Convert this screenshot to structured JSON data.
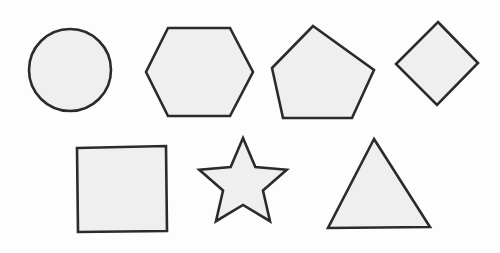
{
  "canvas": {
    "title": "Geometric Shapes",
    "width": 500,
    "height": 253,
    "background_color": "#fdfdfd",
    "shape_fill_color": "#efefef",
    "shape_stroke_color": "#2b2b2b",
    "shape_stroke_width": 2.6,
    "shape_count": 7,
    "row_count": 2
  },
  "shapes": [
    {
      "name": "circle",
      "label": "Circle",
      "row": 1,
      "position_in_row": 1,
      "geometry_type": "circle",
      "center_x": 70,
      "center_y": 70,
      "radius": 41,
      "bounds": {
        "x": 29,
        "y": 29,
        "width": 82,
        "height": 82
      },
      "sides": 0,
      "rotation_deg": 0
    },
    {
      "name": "hexagon",
      "label": "Hexagon",
      "row": 1,
      "position_in_row": 2,
      "geometry_type": "polygon",
      "points": "168,28 230,28 253,72 230,116 168,116 146,72",
      "bounds": {
        "x": 146,
        "y": 28,
        "width": 107,
        "height": 88
      },
      "sides": 6,
      "rotation_deg": 0
    },
    {
      "name": "pentagon",
      "label": "Pentagon",
      "row": 1,
      "position_in_row": 3,
      "geometry_type": "polygon",
      "points": "313,26 374,70 352,118 283,118 272,68",
      "bounds": {
        "x": 272,
        "y": 26,
        "width": 102,
        "height": 92
      },
      "sides": 5,
      "rotation_deg": 0
    },
    {
      "name": "diamond",
      "label": "Diamond",
      "row": 1,
      "position_in_row": 4,
      "geometry_type": "polygon",
      "points": "438,22 478,63 437,105 396,64",
      "bounds": {
        "x": 396,
        "y": 22,
        "width": 82,
        "height": 83
      },
      "sides": 4,
      "rotation_deg": 45
    },
    {
      "name": "square",
      "label": "Square",
      "row": 2,
      "position_in_row": 1,
      "geometry_type": "polygon",
      "points": "77,148 166,146 167,231 78,232",
      "bounds": {
        "x": 77,
        "y": 146,
        "width": 90,
        "height": 86
      },
      "sides": 4,
      "rotation_deg": 1
    },
    {
      "name": "star",
      "label": "Star",
      "row": 2,
      "position_in_row": 2,
      "geometry_type": "star",
      "center_x": 243,
      "center_y": 184,
      "outer_radius": 46,
      "inner_radius": 21,
      "points_count": 5,
      "bounds": {
        "x": 198,
        "y": 139,
        "width": 90,
        "height": 90
      },
      "rotation_deg": 0
    },
    {
      "name": "triangle",
      "label": "Triangle",
      "row": 2,
      "position_in_row": 3,
      "geometry_type": "polygon",
      "points": "374,139 430,227 328,228",
      "bounds": {
        "x": 328,
        "y": 139,
        "width": 102,
        "height": 89
      },
      "sides": 3,
      "rotation_deg": 0
    }
  ]
}
